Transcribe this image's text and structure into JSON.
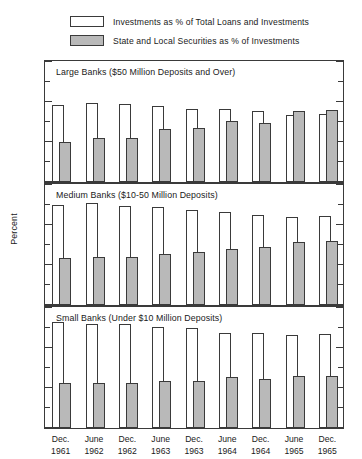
{
  "legend": {
    "items": [
      {
        "swatch": "open-square-icon",
        "style": "open",
        "label": "Investments as % of Total Loans and Investments"
      },
      {
        "swatch": "filled-square-icon",
        "style": "filled",
        "label": "State and Local Securities as % of Investments"
      }
    ]
  },
  "axes": {
    "ylabel": "Percent",
    "ytick_labels": [
      "60",
      "40",
      "20",
      "0"
    ],
    "ytick_values": [
      60,
      40,
      20,
      0
    ],
    "yminor_values": [
      50,
      30,
      10
    ],
    "ylim": [
      0,
      60
    ]
  },
  "colors": {
    "open_fill": "#ffffff",
    "filled_fill": "#b9b9b9",
    "stroke": "#3a3a3a",
    "text": "#1a1a1a",
    "background": "#ffffff"
  },
  "chart_data": {
    "type": "bar",
    "title": "",
    "subtitle": "",
    "xlabel": "",
    "ylabel": "Percent",
    "ylim": [
      0,
      60
    ],
    "grid": false,
    "legend_position": "top",
    "categories": [
      "Dec. 1961",
      "June 1962",
      "Dec. 1962",
      "June 1963",
      "Dec. 1963",
      "June 1964",
      "Dec. 1964",
      "June 1965",
      "Dec. 1965"
    ],
    "category_lines": [
      {
        "month": "Dec.",
        "year": "1961"
      },
      {
        "month": "June",
        "year": "1962"
      },
      {
        "month": "Dec.",
        "year": "1962"
      },
      {
        "month": "June",
        "year": "1963"
      },
      {
        "month": "Dec.",
        "year": "1963"
      },
      {
        "month": "June",
        "year": "1964"
      },
      {
        "month": "Dec.",
        "year": "1964"
      },
      {
        "month": "June",
        "year": "1965"
      },
      {
        "month": "Dec.",
        "year": "1965"
      }
    ],
    "panels": [
      {
        "title": "Large Banks ($50 Million Deposits and Over)",
        "series": [
          {
            "name": "Investments as % of Total Loans and Investments",
            "style": "open",
            "values": [
              38.0,
              39.0,
              38.5,
              37.5,
              36.0,
              36.0,
              35.0,
              33.0,
              33.5
            ]
          },
          {
            "name": "State and Local Securities as % of Investments",
            "style": "filled",
            "values": [
              20.0,
              22.0,
              22.0,
              26.5,
              27.0,
              30.5,
              29.5,
              35.0,
              35.5
            ]
          }
        ]
      },
      {
        "title": "Medium Banks ($10-50 Million Deposits)",
        "series": [
          {
            "name": "Investments as % of Total Loans and Investments",
            "style": "open",
            "values": [
              49.5,
              50.5,
              49.0,
              48.5,
              47.0,
              46.0,
              44.5,
              43.5,
              44.0
            ]
          },
          {
            "name": "State and Local Securities as % of Investments",
            "style": "filled",
            "values": [
              23.5,
              24.0,
              24.0,
              25.5,
              26.5,
              28.0,
              29.0,
              31.0,
              31.5
            ]
          }
        ]
      },
      {
        "title": "Small Banks (Under $10 Million Deposits)",
        "series": [
          {
            "name": "Investments as % of Total Loans and Investments",
            "style": "open",
            "values": [
              52.5,
              51.5,
              51.5,
              50.0,
              49.5,
              47.0,
              47.0,
              46.0,
              46.5
            ]
          },
          {
            "name": "State and Local Securities as % of Investments",
            "style": "filled",
            "values": [
              22.5,
              22.5,
              22.5,
              23.5,
              23.5,
              25.5,
              24.5,
              26.0,
              26.0
            ]
          }
        ]
      }
    ]
  }
}
